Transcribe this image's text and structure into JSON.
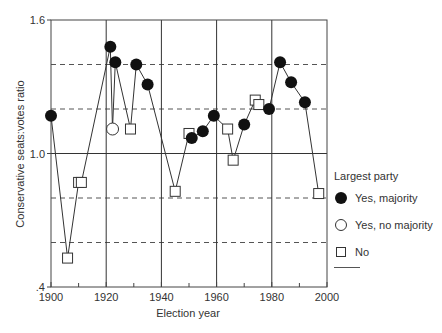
{
  "chart_data": {
    "type": "scatter",
    "title": "",
    "xlabel": "Election year",
    "ylabel": "Conservative seats:votes ratio",
    "xlim": [
      1900,
      2000
    ],
    "ylim": [
      0.4,
      1.6
    ],
    "x_ticks": [
      1900,
      1920,
      1940,
      1960,
      1980,
      2000
    ],
    "x_tick_labels": [
      "1900",
      "1920",
      "1940",
      "1960",
      "1980",
      "2000"
    ],
    "x_minor_ticks": [
      1910,
      1930,
      1950,
      1970,
      1990
    ],
    "y_ticks": [
      0.4,
      1.0,
      1.6
    ],
    "y_tick_labels": [
      ".4",
      "1.0",
      "1.6"
    ],
    "reference_lines": {
      "solid_horizontal": [
        1.0
      ],
      "dashed_horizontal": [
        0.6,
        0.8,
        1.2,
        1.4
      ],
      "solid_vertical": [
        1920,
        1940,
        1960,
        1980
      ]
    },
    "grid": false,
    "connected": true,
    "legend": {
      "title": "Largest party",
      "position": "right",
      "entries": [
        {
          "label": "Yes, majority",
          "marker": "filled-circle"
        },
        {
          "label": "Yes, no majority",
          "marker": "open-circle"
        },
        {
          "label": "No",
          "marker": "open-square"
        }
      ]
    },
    "points": [
      {
        "year": 1900,
        "value": 1.17,
        "category": "Yes, majority"
      },
      {
        "year": 1906,
        "value": 0.53,
        "category": "No"
      },
      {
        "year": 1910,
        "value": 0.87,
        "category": "No"
      },
      {
        "year": 1911,
        "value": 0.87,
        "category": "No"
      },
      {
        "year": 1921.5,
        "value": 1.48,
        "category": "Yes, majority"
      },
      {
        "year": 1922.3,
        "value": 1.11,
        "category": "Yes, no majority"
      },
      {
        "year": 1923.3,
        "value": 1.41,
        "category": "Yes, majority"
      },
      {
        "year": 1928.8,
        "value": 1.11,
        "category": "No"
      },
      {
        "year": 1930.9,
        "value": 1.4,
        "category": "Yes, majority"
      },
      {
        "year": 1935,
        "value": 1.31,
        "category": "Yes, majority"
      },
      {
        "year": 1945,
        "value": 0.83,
        "category": "No"
      },
      {
        "year": 1950,
        "value": 1.09,
        "category": "No"
      },
      {
        "year": 1951,
        "value": 1.07,
        "category": "Yes, majority"
      },
      {
        "year": 1955,
        "value": 1.1,
        "category": "Yes, majority"
      },
      {
        "year": 1959,
        "value": 1.17,
        "category": "Yes, majority"
      },
      {
        "year": 1964,
        "value": 1.11,
        "category": "No"
      },
      {
        "year": 1966,
        "value": 0.97,
        "category": "No"
      },
      {
        "year": 1970,
        "value": 1.13,
        "category": "Yes, majority"
      },
      {
        "year": 1974,
        "value": 1.24,
        "category": "No"
      },
      {
        "year": 1975.3,
        "value": 1.22,
        "category": "No"
      },
      {
        "year": 1979,
        "value": 1.2,
        "category": "Yes, majority"
      },
      {
        "year": 1983,
        "value": 1.41,
        "category": "Yes, majority"
      },
      {
        "year": 1987,
        "value": 1.32,
        "category": "Yes, majority"
      },
      {
        "year": 1992,
        "value": 1.23,
        "category": "Yes, majority"
      },
      {
        "year": 1997,
        "value": 0.82,
        "category": "No"
      }
    ]
  },
  "legend": {
    "title": "Largest party",
    "items": [
      {
        "label": "Yes, majority"
      },
      {
        "label": "Yes, no majority"
      },
      {
        "label": "No"
      }
    ]
  },
  "axes": {
    "x_title": "Election year",
    "y_title": "Conservative seats:votes ratio"
  }
}
